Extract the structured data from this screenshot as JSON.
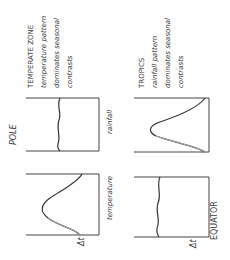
{
  "diagram": {
    "type": "climate-zone seasonal pattern sketch",
    "orientation": "rotated 90deg counter-clockwise",
    "poles": {
      "pole_label": "POLE",
      "equator_label": "EQUATOR"
    },
    "row_labels": {
      "rainfall": "rainfall",
      "temperature": "temperature"
    },
    "delta_symbol": "Δt",
    "zones": [
      {
        "name": "temperate",
        "caption": [
          "TEMPERATE ZONE",
          "temperature pattern",
          "dominates seasonal",
          "contrasts"
        ],
        "rainfall_curve": "flat",
        "temperature_curve": "peaked"
      },
      {
        "name": "tropics",
        "caption": [
          "TROPICS",
          "rainfall pattern",
          "dominates seasonal",
          "contrasts"
        ],
        "rainfall_curve": "peaked",
        "temperature_curve": "flat"
      }
    ]
  },
  "colors": {
    "ink": "#3a3a3a",
    "ink_light": "#9a9a9a",
    "background": "#ffffff"
  }
}
